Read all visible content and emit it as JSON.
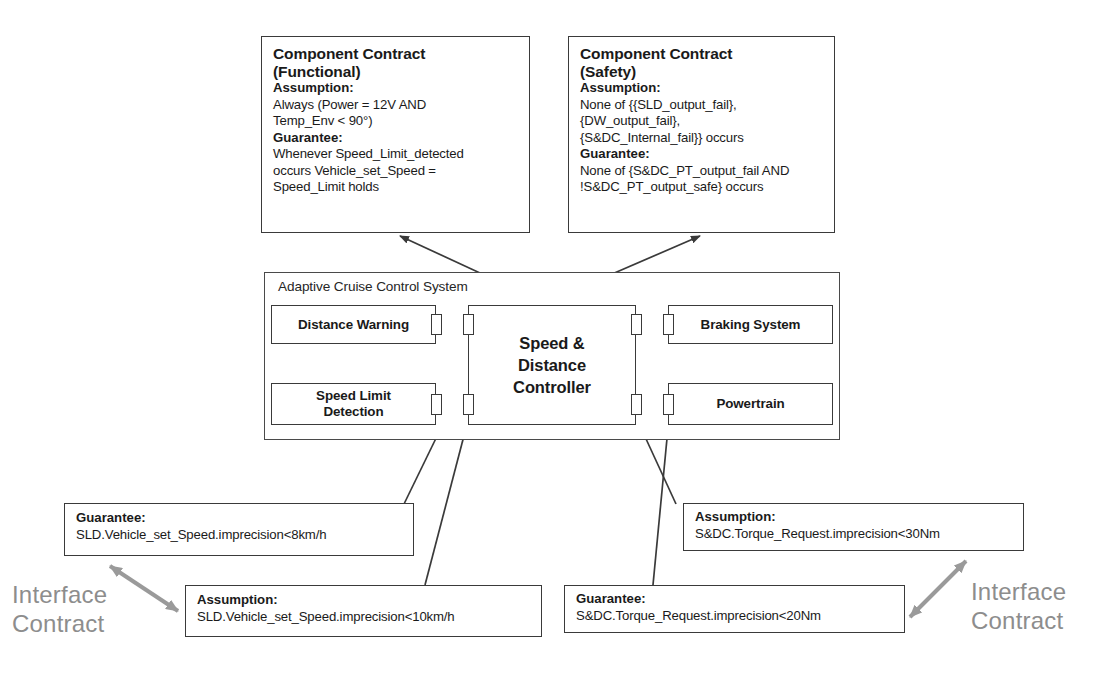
{
  "contracts": {
    "functional": {
      "title_line1": "Component Contract",
      "title_line2": "(Functional)",
      "assumption_label": "Assumption:",
      "assumption_line1": "Always (Power = 12V AND",
      "assumption_line2": "Temp_Env < 90°)",
      "guarantee_label": "Guarantee:",
      "guarantee_line1": "Whenever Speed_Limit_detected",
      "guarantee_line2": "occurs Vehicle_set_Speed =",
      "guarantee_line3": "Speed_Limit holds"
    },
    "safety": {
      "title_line1": "Component Contract",
      "title_line2": "(Safety)",
      "assumption_label": "Assumption:",
      "assumption_line1": "None of {{SLD_output_fail},",
      "assumption_line2": "{DW_output_fail},",
      "assumption_line3": "{S&DC_Internal_fail}} occurs",
      "guarantee_label": "Guarantee:",
      "guarantee_line1": "None of {S&DC_PT_output_fail AND",
      "guarantee_line2": "!S&DC_PT_output_safe} occurs"
    }
  },
  "system": {
    "title": "Adaptive Cruise Control System",
    "blocks": [
      {
        "id": "distance-warning",
        "label": "Distance Warning"
      },
      {
        "id": "speed-limit-detection",
        "label_line1": "Speed Limit",
        "label_line2": "Detection"
      },
      {
        "id": "speed-distance-controller",
        "label_line1": "Speed &",
        "label_line2": "Distance",
        "label_line3": "Controller"
      },
      {
        "id": "braking-system",
        "label": "Braking System"
      },
      {
        "id": "powertrain",
        "label": "Powertrain"
      }
    ]
  },
  "interface_contracts": {
    "left_label_line1": "Interface",
    "left_label_line2": "Contract",
    "right_label_line1": "Interface",
    "right_label_line2": "Contract",
    "sld_guarantee": {
      "label": "Guarantee:",
      "text": "SLD.Vehicle_set_Speed.imprecision<8km/h"
    },
    "sld_assumption": {
      "label": "Assumption:",
      "text": "SLD.Vehicle_set_Speed.imprecision<10km/h"
    },
    "sdc_assumption": {
      "label": "Assumption:",
      "text": "S&DC.Torque_Request.imprecision<30Nm"
    },
    "sdc_guarantee": {
      "label": "Guarantee:",
      "text": "S&DC.Torque_Request.imprecision<20Nm"
    }
  },
  "colors": {
    "stroke": "#3a3a3a",
    "interface_gray": "#8d8d8d",
    "background": "#ffffff"
  }
}
